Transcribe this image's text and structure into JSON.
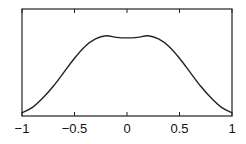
{
  "chart_data": {
    "type": "line",
    "title": "",
    "xlabel": "",
    "ylabel": "",
    "xlim": [
      -1,
      1
    ],
    "ylim": [
      0,
      1
    ],
    "grid": false,
    "legend": null,
    "x_ticks": [
      -1,
      -0.5,
      0,
      0.5,
      1
    ],
    "x_tick_labels": [
      "−1",
      "−0.5",
      "0",
      "0.5",
      "1"
    ],
    "y_ticks": [],
    "series": [
      {
        "name": "curve",
        "color": "#222222",
        "x": [
          -1,
          -0.9,
          -0.8,
          -0.7,
          -0.6,
          -0.5,
          -0.4,
          -0.3,
          -0.2,
          -0.1,
          0,
          0.1,
          0.2,
          0.3,
          0.4,
          0.5,
          0.6,
          0.7,
          0.8,
          0.9,
          1
        ],
        "y": [
          0.03,
          0.08,
          0.17,
          0.28,
          0.41,
          0.54,
          0.65,
          0.72,
          0.75,
          0.735,
          0.73,
          0.735,
          0.75,
          0.72,
          0.65,
          0.54,
          0.41,
          0.28,
          0.17,
          0.08,
          0.03
        ]
      }
    ]
  }
}
